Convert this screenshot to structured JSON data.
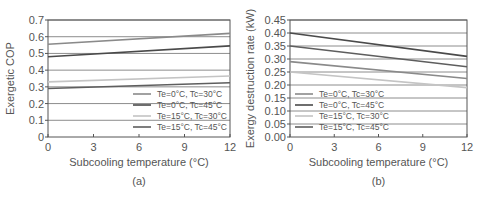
{
  "chart_data": [
    {
      "type": "line",
      "panel_label": "(a)",
      "title": "",
      "xlabel": "Subcooling temperature (°C)",
      "ylabel": "Exergetic COP",
      "xlim": [
        0,
        12
      ],
      "ylim": [
        0,
        0.7
      ],
      "xticks": [
        "0",
        "3",
        "6",
        "9",
        "12"
      ],
      "yticks": [
        "0",
        "0.1",
        "0.2",
        "0.3",
        "0.4",
        "0.5",
        "0.6",
        "0.7"
      ],
      "grid": "horizontal",
      "legend_position": "lower right",
      "x": [
        0,
        12
      ],
      "series": [
        {
          "name": "Te=0°C, Tc=30°C",
          "color": "#8a8a8a",
          "values": [
            0.555,
            0.62
          ]
        },
        {
          "name": "Te=0°C, Tc=45°C",
          "color": "#4a4a4a",
          "values": [
            0.48,
            0.545
          ]
        },
        {
          "name": "Te=15°C, Tc=30°C",
          "color": "#c4c4c4",
          "values": [
            0.33,
            0.365
          ]
        },
        {
          "name": "Te=15°C, Tc=45°C",
          "color": "#5e5e5e",
          "values": [
            0.29,
            0.325
          ]
        }
      ]
    },
    {
      "type": "line",
      "panel_label": "(b)",
      "title": "",
      "xlabel": "Subcooling temperature (°C)",
      "ylabel": "Exergy destruction rate (kW)",
      "xlim": [
        0,
        12
      ],
      "ylim": [
        0,
        0.45
      ],
      "xticks": [
        "0",
        "3",
        "6",
        "9",
        "12"
      ],
      "yticks": [
        "0.00",
        "0.05",
        "0.10",
        "0.15",
        "0.20",
        "0.25",
        "0.30",
        "0.35",
        "0.40",
        "0.45"
      ],
      "grid": "horizontal",
      "legend_position": "lower left",
      "x": [
        0,
        12
      ],
      "series": [
        {
          "name": "Te=0°C, Tc=30°C",
          "color": "#8a8a8a",
          "values": [
            0.29,
            0.225
          ]
        },
        {
          "name": "Te=0°C, Tc=45°C",
          "color": "#4a4a4a",
          "values": [
            0.4,
            0.31
          ]
        },
        {
          "name": "Te=15°C, Tc=30°C",
          "color": "#c4c4c4",
          "values": [
            0.25,
            0.19
          ]
        },
        {
          "name": "Te=15°C, Tc=45°C",
          "color": "#5e5e5e",
          "values": [
            0.35,
            0.27
          ]
        }
      ]
    }
  ]
}
